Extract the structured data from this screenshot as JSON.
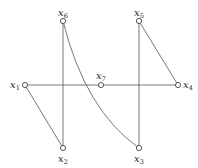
{
  "diagram": {
    "type": "graph",
    "nodes": [
      {
        "id": "x1",
        "label": "x",
        "sub": "1",
        "x": 25,
        "y": 85,
        "label_pos": "left"
      },
      {
        "id": "x2",
        "label": "x",
        "sub": "2",
        "x": 63,
        "y": 148,
        "label_pos": "below"
      },
      {
        "id": "x3",
        "label": "x",
        "sub": "3",
        "x": 139,
        "y": 148,
        "label_pos": "below"
      },
      {
        "id": "x4",
        "label": "x",
        "sub": "4",
        "x": 178,
        "y": 85,
        "label_pos": "right"
      },
      {
        "id": "x5",
        "label": "x",
        "sub": "5",
        "x": 139,
        "y": 21,
        "label_pos": "above"
      },
      {
        "id": "x6",
        "label": "x",
        "sub": "6",
        "x": 63,
        "y": 21,
        "label_pos": "above"
      },
      {
        "id": "x7",
        "label": "x",
        "sub": "7",
        "x": 101,
        "y": 85,
        "label_pos": "above"
      }
    ],
    "edges": [
      {
        "from": "x1",
        "to": "x2",
        "shape": "line"
      },
      {
        "from": "x1",
        "to": "x4",
        "shape": "line"
      },
      {
        "from": "x6",
        "to": "x2",
        "shape": "line"
      },
      {
        "from": "x5",
        "to": "x3",
        "shape": "line"
      },
      {
        "from": "x5",
        "to": "x4",
        "shape": "line"
      },
      {
        "from": "x6",
        "to": "x3",
        "shape": "curve"
      }
    ]
  }
}
